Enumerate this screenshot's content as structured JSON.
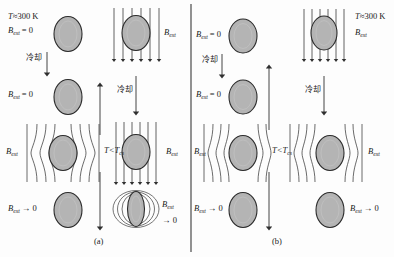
{
  "figure": {
    "divider_x": 191,
    "colors": {
      "ellipse_fill": "#b4b4b4",
      "ellipse_stroke": "#2b2b2b",
      "field_line": "#3a3a3a",
      "divider": "#3a3a3a",
      "background": "#fdfdfd",
      "text": "#1a1a1a"
    }
  },
  "panels": [
    {
      "id": "a",
      "caption": "(a)",
      "process": "zero-field cooling then field applied / field removed",
      "rows": [
        {
          "left": {
            "labels": [
              "T≈300 K",
              "B_ext = 0"
            ],
            "field": "none"
          },
          "right": {
            "labels": [
              "B_ext"
            ],
            "field": "uniform-down"
          }
        },
        {
          "left": {
            "labels": [
              "B_ext = 0"
            ],
            "field": "none"
          },
          "right": {
            "labels": [],
            "field": "none"
          }
        },
        {
          "left": {
            "labels": [
              "B_ext"
            ],
            "field": "expelled"
          },
          "right": {
            "labels": [
              "B_ext"
            ],
            "field": "uniform-down"
          }
        },
        {
          "left": {
            "labels": [
              "B_ext → 0"
            ],
            "field": "none"
          },
          "right": {
            "labels": [
              "B_ext",
              "→ 0"
            ],
            "field": "trapped-loops"
          }
        }
      ],
      "center_labels": [
        "冷却",
        "T<T_cs"
      ],
      "arrows": [
        "up",
        "down"
      ]
    },
    {
      "id": "b",
      "caption": "(b)",
      "process": "field cooling both branches, field expelled at low T",
      "rows": [
        {
          "left": {
            "labels": [
              "B_ext = 0"
            ],
            "field": "none"
          },
          "right": {
            "labels": [
              "T≈300 K",
              "B_ext"
            ],
            "field": "uniform-down"
          }
        },
        {
          "left": {
            "labels": [
              "B_ext = 0"
            ],
            "field": "none"
          },
          "right": {
            "labels": [],
            "field": "none"
          }
        },
        {
          "left": {
            "labels": [
              "B_ext"
            ],
            "field": "expelled"
          },
          "right": {
            "labels": [
              "B_ext"
            ],
            "field": "expelled"
          }
        },
        {
          "left": {
            "labels": [
              "B_ext → 0"
            ],
            "field": "none"
          },
          "right": {
            "labels": [
              "B_ext → 0"
            ],
            "field": "none"
          }
        }
      ],
      "center_labels": [
        "冷却",
        "T<T_cs"
      ],
      "arrows": [
        "up",
        "down"
      ]
    }
  ],
  "text": {
    "temp_room": "T≈300 K",
    "b_zero": "B_ext = 0",
    "b_ext": "B_ext",
    "b_to_zero": "B_ext → 0",
    "to_zero": "→ 0",
    "cooling": "冷却",
    "t_below_tc": "T<T_cs",
    "caption_a": "(a)",
    "caption_b": "(b)",
    "sym_B": "B",
    "sym_ext": "ext",
    "sym_eq_zero": " = 0",
    "sym_arrow_zero": " → 0",
    "sym_T": "T",
    "sym_approx300": "≈300 K",
    "sym_Tless": "T<T",
    "sym_cs": "cs"
  }
}
